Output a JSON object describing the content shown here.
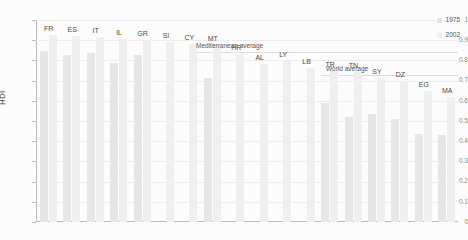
{
  "chart_data": {
    "type": "bar",
    "title": "",
    "xlabel": "",
    "ylabel": "HDI",
    "ylim": [
      0,
      1
    ],
    "ytick_labels": [
      "1",
      "0.9",
      "0.8",
      "0.7",
      "0.6",
      "0.5",
      "0.4",
      "0.3",
      "0.2",
      "0.1",
      "0"
    ],
    "ytick_values": [
      1,
      0.9,
      0.8,
      0.7,
      0.6,
      0.5,
      0.4,
      0.3,
      0.2,
      0.1,
      0
    ],
    "grid": true,
    "legend_position": "top-right",
    "categories": [
      "FR",
      "ES",
      "IT",
      "IL",
      "GR",
      "SI",
      "CY",
      "MT",
      "HR",
      "AL",
      "LY",
      "LB",
      "TR",
      "TN",
      "SY",
      "DZ",
      "EG",
      "MA"
    ],
    "series": [
      {
        "name": "1975",
        "color": "#e6e6e6",
        "values": [
          0.845,
          0.825,
          0.835,
          0.785,
          0.825,
          null,
          null,
          0.715,
          null,
          null,
          null,
          null,
          0.59,
          0.52,
          0.535,
          0.51,
          0.435,
          0.43
        ]
      },
      {
        "name": "2002",
        "color": "#efefef",
        "values": [
          0.925,
          0.92,
          0.915,
          0.905,
          0.9,
          0.89,
          0.88,
          0.875,
          0.83,
          0.78,
          0.795,
          0.76,
          0.75,
          0.745,
          0.715,
          0.7,
          0.65,
          0.62
        ]
      }
    ],
    "reference_lines": [
      {
        "label": "Mediterranean average",
        "value": 0.84
      },
      {
        "label": "World average",
        "value": 0.73
      }
    ]
  },
  "legend": {
    "items": [
      {
        "label": "1975",
        "color": "#e6e6e6"
      },
      {
        "label": "2002",
        "color": "#efefef"
      }
    ]
  }
}
